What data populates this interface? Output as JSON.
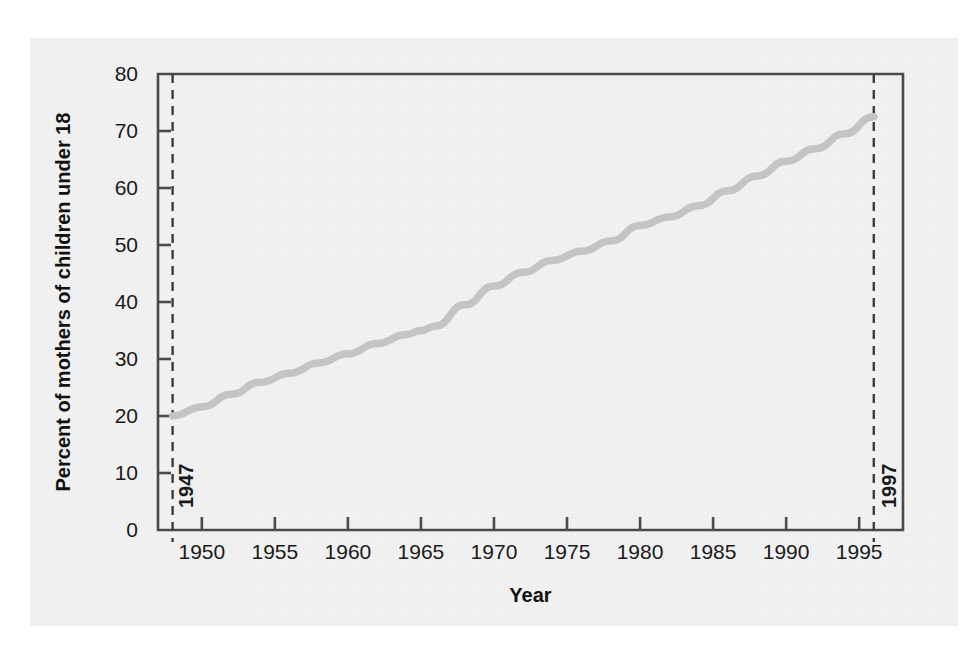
{
  "chart_data": {
    "type": "line",
    "title": "",
    "xlabel": "Year",
    "ylabel": "Percent of mothers of children under 18",
    "xlim": [
      1947,
      1998
    ],
    "ylim": [
      0,
      80
    ],
    "grid": false,
    "legend": "none",
    "line_color": "#c4c4c4",
    "axis_color": "#4a4a4a",
    "x_ticks": [
      1950,
      1955,
      1960,
      1965,
      1970,
      1975,
      1980,
      1985,
      1990,
      1995
    ],
    "x_tick_labels": [
      "1950",
      "1955",
      "1960",
      "1965",
      "1970",
      "1975",
      "1980",
      "1985",
      "1990",
      "1995"
    ],
    "y_ticks": [
      0,
      10,
      20,
      30,
      40,
      50,
      60,
      70,
      80
    ],
    "y_tick_labels": [
      "0",
      "10",
      "20",
      "30",
      "40",
      "50",
      "60",
      "70",
      "80"
    ],
    "annotations": [
      {
        "name": "start-year-marker",
        "label": "1947",
        "x": 1948,
        "style": "dashed-vertical",
        "label_rotation": -90
      },
      {
        "name": "end-year-marker",
        "label": "1997",
        "x": 1996,
        "style": "dashed-vertical",
        "label_rotation": -90
      }
    ],
    "series": [
      {
        "name": "Percent of mothers of children under 18 in the labor force",
        "x": [
          1948,
          1950,
          1952,
          1954,
          1956,
          1958,
          1960,
          1962,
          1964,
          1965,
          1966,
          1968,
          1970,
          1972,
          1974,
          1976,
          1978,
          1980,
          1982,
          1984,
          1986,
          1988,
          1990,
          1992,
          1994,
          1996
        ],
        "values": [
          20.0,
          21.6,
          23.8,
          25.9,
          27.5,
          29.3,
          30.9,
          32.7,
          34.3,
          35.0,
          35.8,
          39.5,
          42.8,
          45.2,
          47.3,
          48.9,
          50.7,
          53.4,
          54.9,
          56.9,
          59.5,
          62.1,
          64.7,
          66.9,
          69.5,
          72.5
        ]
      }
    ]
  }
}
